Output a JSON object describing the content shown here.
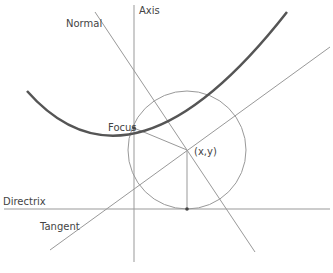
{
  "labels": {
    "axis": "Axis",
    "normal": "Normal",
    "focus": "Focus",
    "point": "(x,y)",
    "directrix": "Directrix",
    "tangent": "Tangent"
  },
  "colors": {
    "parabola": "#555555",
    "lines": "#999999",
    "text": "#444444"
  }
}
